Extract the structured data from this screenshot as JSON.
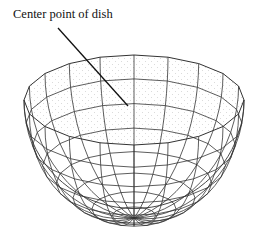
{
  "figure": {
    "callout": {
      "label": "Center point of dish",
      "line_from": [
        58,
        28
      ],
      "line_to": [
        128,
        106
      ]
    },
    "dish": {
      "rim_center": [
        134,
        100
      ],
      "rim_rx": 110,
      "rim_ry": 45,
      "depth": 118,
      "meridians": 20,
      "parallels": 8,
      "line_color": "#333333",
      "stipple_color": "#b5b5b5"
    }
  }
}
